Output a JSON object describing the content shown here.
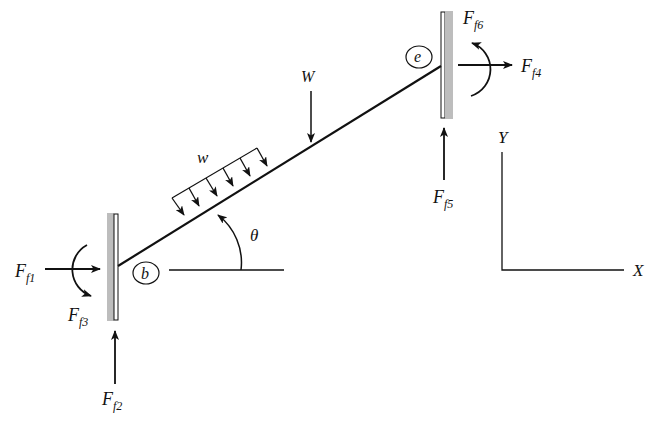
{
  "diagram": {
    "type": "free-body diagram",
    "members": {
      "beam": {
        "from": "b",
        "to": "e",
        "angle_label": "θ"
      }
    },
    "nodes": {
      "b": {
        "label": "b"
      },
      "e": {
        "label": "e"
      }
    },
    "loads": {
      "distributed": {
        "label": "w"
      },
      "point": {
        "label": "W"
      }
    },
    "reactions": {
      "f1": {
        "main": "F",
        "sub": "f1"
      },
      "f2": {
        "main": "F",
        "sub": "f2"
      },
      "f3": {
        "main": "F",
        "sub": "f3"
      },
      "f4": {
        "main": "F",
        "sub": "f4"
      },
      "f5": {
        "main": "F",
        "sub": "f5"
      },
      "f6": {
        "main": "F",
        "sub": "f6"
      }
    },
    "axes": {
      "x_label": "X",
      "y_label": "Y"
    },
    "colors": {
      "line": "#111111",
      "wall_fill": "#bdbdbd"
    }
  }
}
